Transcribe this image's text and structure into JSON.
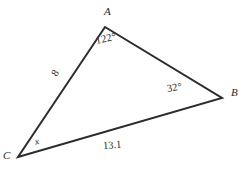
{
  "figure": {
    "type": "triangle-diagram",
    "background_color": "#ffffff",
    "stroke_color": "#2b2b2b",
    "stroke_width": 2,
    "width": 245,
    "height": 173
  },
  "vertices": {
    "a": {
      "label": "A",
      "x": 105,
      "y": 27
    },
    "b": {
      "label": "B",
      "x": 222,
      "y": 98
    },
    "c": {
      "label": "C",
      "x": 18,
      "y": 157
    }
  },
  "angles": {
    "at_a": "122°",
    "at_b": "32°",
    "at_c": "x"
  },
  "sides": {
    "ca": "8",
    "cb": "13.1"
  },
  "chart_data": {
    "type": "diagram",
    "title": "",
    "shape": "triangle",
    "vertex_labels": [
      "A",
      "B",
      "C"
    ],
    "vertex_points": [
      [
        105,
        27
      ],
      [
        222,
        98
      ],
      [
        18,
        157
      ]
    ],
    "edges": [
      {
        "from": "A",
        "to": "B",
        "label": ""
      },
      {
        "from": "B",
        "to": "C",
        "label": "13.1"
      },
      {
        "from": "C",
        "to": "A",
        "label": "8"
      }
    ],
    "angle_labels": [
      {
        "vertex": "A",
        "value": "122°"
      },
      {
        "vertex": "B",
        "value": "32°"
      },
      {
        "vertex": "C",
        "value": "x"
      }
    ]
  }
}
